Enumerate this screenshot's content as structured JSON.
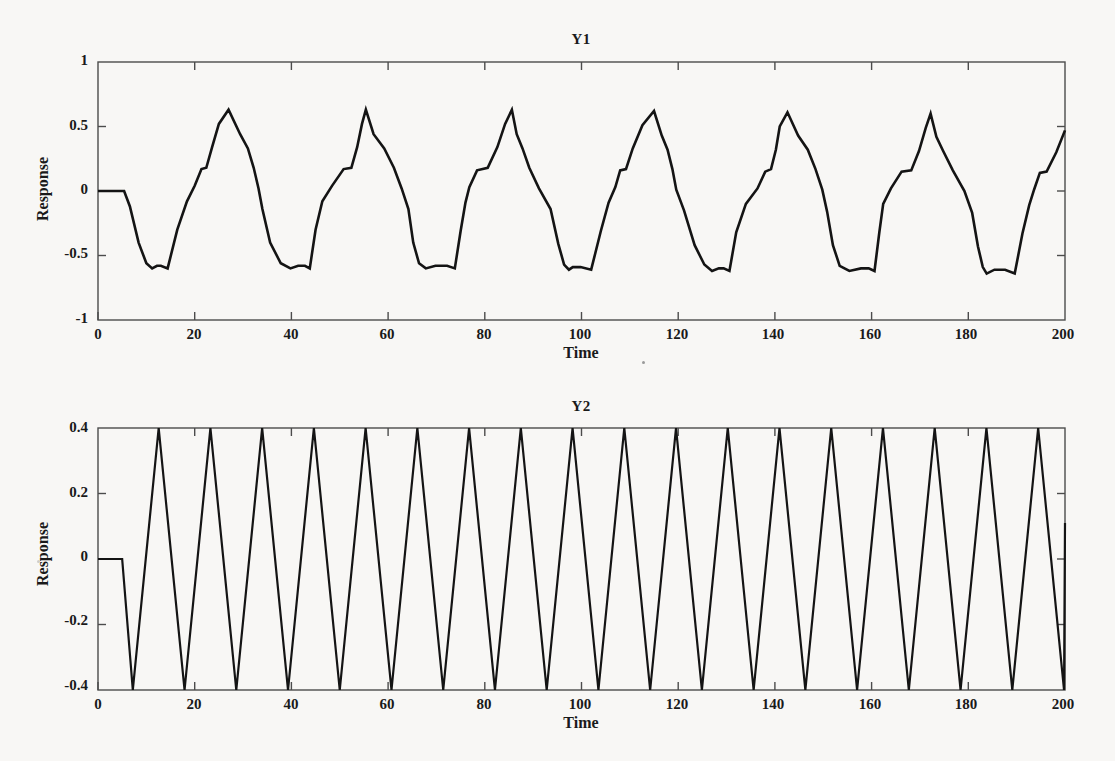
{
  "figure": {
    "background_color": "#f8f7f5",
    "line_color": "#141414",
    "frame_color": "#4c4c4c"
  },
  "chart_data": [
    {
      "type": "line",
      "title": "Y1",
      "xlabel": "Time",
      "ylabel": "Response",
      "xlim": [
        0,
        200
      ],
      "ylim": [
        -1,
        1
      ],
      "xticks": [
        0,
        20,
        40,
        60,
        80,
        100,
        120,
        140,
        160,
        180,
        200
      ],
      "xticklabels": [
        "0",
        "20",
        "40",
        "60",
        "80",
        "100",
        "120",
        "140",
        "160",
        "180",
        "200"
      ],
      "yticks": [
        -1,
        -0.5,
        0,
        0.5,
        1
      ],
      "yticklabels": [
        "-1",
        "-0.5",
        "0",
        "0.5",
        "1"
      ],
      "grid": false,
      "legend": "none",
      "waveform": "asymmetric relaxation oscillation, period approx 21.4, peak approx +0.63 decaying to +0.54, trough approx -0.60 to -0.66",
      "series": [
        {
          "name": "Y1",
          "x": [
            0,
            3.0,
            5.4,
            6.6,
            8.4,
            10.0,
            11.2,
            12.2,
            13.0,
            14.4,
            16.4,
            18.4,
            20.0,
            21.4,
            22.4,
            23.6,
            25.0,
            27.0,
            29.4,
            31.0,
            32.2,
            33.2,
            34.0,
            35.6,
            37.8,
            39.8,
            41.4,
            42.8,
            43.8,
            45.0,
            46.4,
            48.4,
            50.8,
            52.4,
            53.6,
            54.6,
            55.4,
            57.0,
            59.2,
            61.2,
            62.8,
            64.2,
            65.2,
            66.4,
            67.8,
            69.8,
            72.2,
            73.8,
            75.0,
            76.0,
            76.8,
            78.4,
            80.6,
            82.6,
            84.2,
            85.6,
            86.6,
            87.8,
            89.2,
            91.2,
            93.6,
            95.2,
            96.4,
            97.4,
            98.2,
            99.8,
            102.0,
            104.0,
            105.6,
            107.0,
            108.0,
            109.2,
            110.6,
            112.6,
            115.0,
            116.6,
            117.8,
            118.8,
            119.6,
            121.2,
            123.4,
            125.4,
            127.0,
            128.4,
            129.4,
            130.6,
            132.0,
            134.0,
            136.4,
            138.0,
            139.2,
            140.2,
            141.0,
            142.6,
            144.8,
            146.8,
            148.4,
            149.8,
            150.8,
            152.0,
            153.4,
            155.4,
            157.8,
            159.4,
            160.6,
            161.6,
            162.4,
            164.0,
            166.2,
            168.2,
            169.8,
            171.2,
            172.2,
            173.4,
            174.8,
            176.8,
            179.2,
            180.8,
            182.0,
            183.0,
            183.8,
            185.4,
            187.6,
            189.6,
            191.2,
            192.6,
            193.6,
            194.8,
            196.2,
            198.2,
            200
          ],
          "y": [
            0,
            0,
            0,
            -0.12,
            -0.4,
            -0.56,
            -0.6,
            -0.58,
            -0.58,
            -0.6,
            -0.3,
            -0.08,
            0.04,
            0.17,
            0.18,
            0.34,
            0.52,
            0.63,
            0.44,
            0.33,
            0.18,
            0.02,
            -0.14,
            -0.4,
            -0.56,
            -0.6,
            -0.58,
            -0.58,
            -0.6,
            -0.3,
            -0.08,
            0.04,
            0.17,
            0.18,
            0.34,
            0.52,
            0.63,
            0.44,
            0.33,
            0.18,
            0.02,
            -0.14,
            -0.4,
            -0.56,
            -0.6,
            -0.58,
            -0.58,
            -0.6,
            -0.31,
            -0.09,
            0.03,
            0.16,
            0.18,
            0.34,
            0.52,
            0.63,
            0.44,
            0.33,
            0.18,
            0.02,
            -0.14,
            -0.41,
            -0.57,
            -0.61,
            -0.59,
            -0.59,
            -0.61,
            -0.31,
            -0.09,
            0.03,
            0.16,
            0.17,
            0.33,
            0.51,
            0.62,
            0.43,
            0.32,
            0.17,
            0.01,
            -0.15,
            -0.42,
            -0.57,
            -0.62,
            -0.6,
            -0.6,
            -0.62,
            -0.32,
            -0.1,
            0.02,
            0.15,
            0.17,
            0.32,
            0.5,
            0.61,
            0.43,
            0.32,
            0.17,
            0.01,
            -0.16,
            -0.42,
            -0.58,
            -0.62,
            -0.6,
            -0.6,
            -0.62,
            -0.32,
            -0.1,
            0.02,
            0.15,
            0.16,
            0.31,
            0.49,
            0.6,
            0.42,
            0.31,
            0.16,
            0.0,
            -0.17,
            -0.43,
            -0.59,
            -0.64,
            -0.61,
            -0.61,
            -0.64,
            -0.33,
            -0.11,
            0.01,
            0.14,
            0.15,
            0.3,
            0.47,
            0.58,
            -0.62
          ]
        }
      ]
    },
    {
      "type": "line",
      "title": "Y2",
      "xlabel": "Time",
      "ylabel": "Response",
      "xlim": [
        0,
        200
      ],
      "ylim": [
        -0.4,
        0.4
      ],
      "xticks": [
        0,
        20,
        40,
        60,
        80,
        100,
        120,
        140,
        160,
        180,
        200
      ],
      "xticklabels": [
        "0",
        "20",
        "40",
        "60",
        "80",
        "100",
        "120",
        "140",
        "160",
        "180",
        "200"
      ],
      "yticks": [
        -0.4,
        -0.2,
        0,
        0.2,
        0.4
      ],
      "yticklabels": [
        "-0.4",
        "-0.2",
        "0",
        "0.2",
        "0.4"
      ],
      "grid": false,
      "legend": "none",
      "waveform": "symmetric triangle wave, period approx 10.7, amplitude approx 0.40, flat at 0 for t < 5, ends rising at approx +0.11 at t = 200",
      "series": [
        {
          "name": "Y2",
          "amplitude": 0.4,
          "period": 10.7,
          "flat_start_end": 5.0,
          "first_trough_t": 7.2,
          "first_peak_t": 11.0,
          "end_value": 0.11
        }
      ]
    }
  ]
}
